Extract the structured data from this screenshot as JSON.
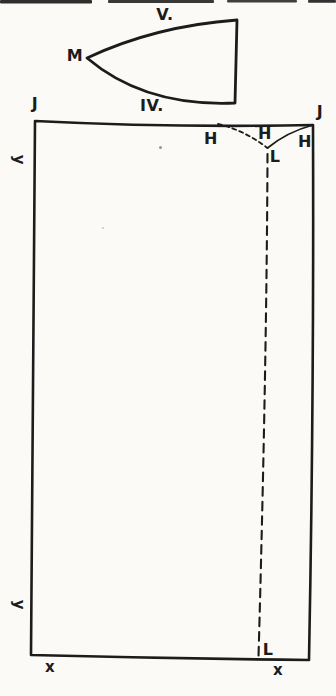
{
  "colors": {
    "paper": "#fbfaf7",
    "ink": "#1c1c1c"
  },
  "top_piece": {
    "number_label": "V.",
    "tip_label": "M"
  },
  "main_piece": {
    "number_label": "IV.",
    "corner_top_left": "J",
    "corner_top_right": "J",
    "dart": {
      "h_left": "H",
      "h_middle": "H",
      "h_right": "H",
      "l_top": "L"
    },
    "fold_line_bottom_label": "L",
    "side_label_upper": "y",
    "side_label_lower": "y",
    "bottom_label_left": "x",
    "bottom_label_right": "x"
  }
}
